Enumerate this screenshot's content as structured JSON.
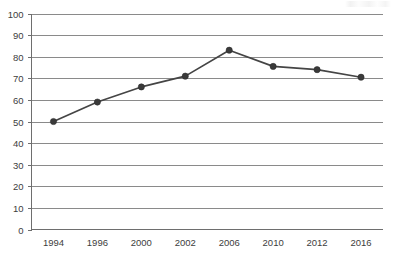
{
  "chart_data": {
    "type": "line",
    "title": "",
    "subtitle": "",
    "xlabel": "",
    "ylabel": "",
    "categories": [
      "1994",
      "1996",
      "2000",
      "2002",
      "2006",
      "2010",
      "2012",
      "2016"
    ],
    "values": [
      50,
      59,
      66,
      71,
      83,
      75.5,
      74,
      70.5
    ],
    "series": [
      {
        "name": "",
        "values": [
          50,
          59,
          66,
          71,
          83,
          75.5,
          74,
          70.5
        ]
      }
    ],
    "ylim": [
      0,
      100
    ],
    "ytick_labels": [
      "100",
      "90",
      "80",
      "70",
      "60",
      "50",
      "40",
      "30",
      "20",
      "10",
      "0"
    ],
    "ytick_values": [
      100,
      90,
      80,
      70,
      60,
      50,
      40,
      30,
      20,
      10,
      0
    ],
    "xtick_labels": [
      "1994",
      "1996",
      "2000",
      "2002",
      "2006",
      "2010",
      "2012",
      "2016"
    ],
    "grid": "horizontal",
    "legend": "none",
    "annotations": [],
    "colors": {
      "line": "#454545",
      "marker": "#3a3a3a",
      "gridline": "#8a8a8a",
      "axis": "#6e6e6e",
      "background": "#ffffff",
      "text": "#3d3d3d"
    }
  }
}
